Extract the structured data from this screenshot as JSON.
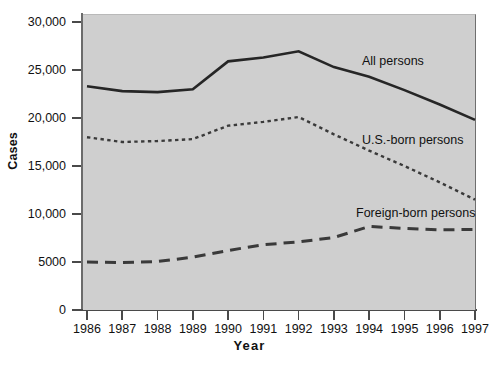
{
  "chart_data": {
    "type": "line",
    "title": "",
    "xlabel": "Year",
    "ylabel": "Cases",
    "x": [
      1986,
      1987,
      1988,
      1989,
      1990,
      1991,
      1992,
      1993,
      1994,
      1995,
      1996,
      1997
    ],
    "xtick_labels": [
      "1986",
      "1987",
      "1988",
      "1989",
      "1990",
      "1991",
      "1992",
      "1993",
      "1994",
      "1995",
      "1996",
      "1997"
    ],
    "ytick_labels": [
      "0",
      "5000",
      "10,000",
      "15,000",
      "20,000",
      "25,000",
      "30,000"
    ],
    "ytick_values": [
      0,
      5000,
      10000,
      15000,
      20000,
      25000,
      30000
    ],
    "ylim": [
      0,
      31000
    ],
    "xlim": [
      1986,
      1997
    ],
    "grid": false,
    "legend_position": "inline-annotations",
    "plot_background": "#cfcfcf",
    "series": [
      {
        "name": "All persons",
        "style": "solid",
        "color": "#262626",
        "values": [
          23300,
          22800,
          22700,
          23000,
          25900,
          26300,
          26950,
          25300,
          24300,
          22900,
          21400,
          19800
        ]
      },
      {
        "name": "U.S.-born persons",
        "style": "dotted",
        "color": "#3a3a3a",
        "values": [
          18000,
          17500,
          17600,
          17800,
          19200,
          19600,
          20100,
          18300,
          16600,
          15000,
          13300,
          11500
        ]
      },
      {
        "name": "Foreign-born persons",
        "style": "dashed",
        "color": "#3a3a3a",
        "values": [
          5000,
          4950,
          5050,
          5500,
          6200,
          6800,
          7100,
          7550,
          8700,
          8500,
          8350,
          8400
        ]
      }
    ],
    "annotations": [
      {
        "text": "All persons",
        "x": 1993.2,
        "y": 27200
      },
      {
        "text": "U.S.-born persons",
        "x": 1993.2,
        "y": 18900
      },
      {
        "text": "Foreign-born persons",
        "x": 1993.0,
        "y": 11400
      }
    ]
  }
}
